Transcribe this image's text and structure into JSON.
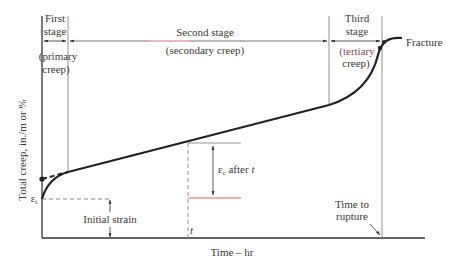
{
  "diagram": {
    "colors": {
      "curve": "#222222",
      "axis": "#333333",
      "guide": "#777777",
      "accent_red": "#d9534f",
      "accent_tertiary_text": "#8a4a5a"
    },
    "stages": [
      {
        "name": "First",
        "name2": "stage",
        "desc1": "(primary",
        "desc2": "creep)"
      },
      {
        "name": "Second stage",
        "desc": "(secondary creep)"
      },
      {
        "name": "Third",
        "name2": "stage",
        "desc1": "(tertiary",
        "desc2": "creep)"
      }
    ],
    "labels": {
      "fracture": "Fracture",
      "y_axis": "Total creep, in./m or %",
      "x_axis": "Time – hr",
      "epsilon_i": "ε",
      "epsilon_i_sub": "i",
      "initial_strain": "Initial strain",
      "epsilon_c": "ε",
      "epsilon_c_sub": "c",
      "after_t": " after ",
      "t_italic": "t",
      "t_marker": "t",
      "time_to": "Time to",
      "rupture": "rupture"
    }
  }
}
